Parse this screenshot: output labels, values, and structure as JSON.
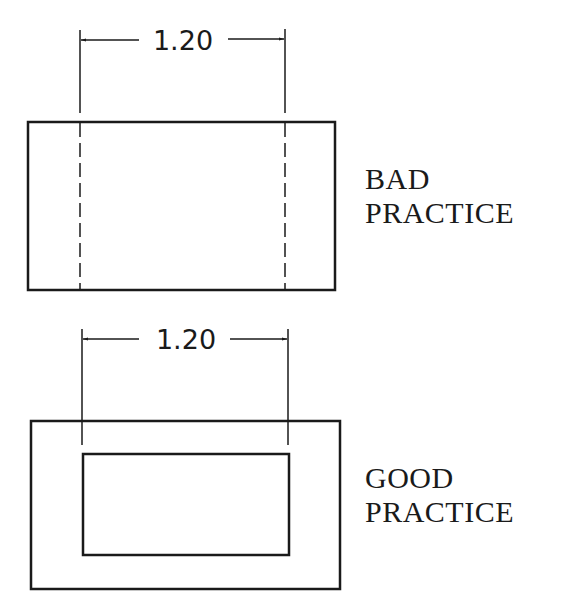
{
  "figures": [
    {
      "id": "bad",
      "dimension_value": "1.20",
      "label_line1": "BAD",
      "label_line2": "PRACTICE",
      "description": "Dimension to hidden lines"
    },
    {
      "id": "good",
      "dimension_value": "1.20",
      "label_line1": "GOOD",
      "label_line2": "PRACTICE",
      "description": "Dimension to visible lines"
    }
  ],
  "colors": {
    "line": "#1a1a1a",
    "background": "#ffffff"
  }
}
